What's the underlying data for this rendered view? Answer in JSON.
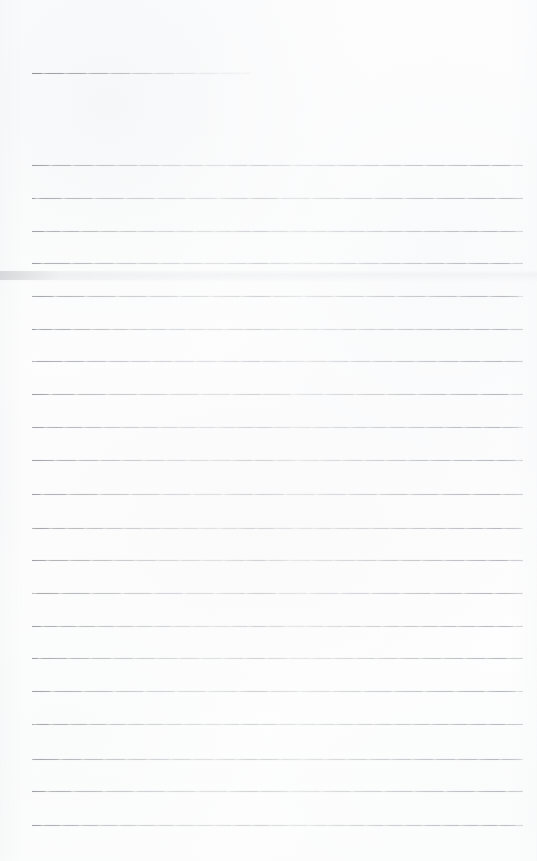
{
  "document": {
    "kind": "scanned-ruled-paper",
    "title": "",
    "visible_text": "",
    "page_width": 537,
    "page_height": 861,
    "background_color": "#fdfdfd",
    "rule_color": "#9a9da1",
    "rule_color_faded": "#c8cacd",
    "notes": "Blank scanned sheet of ruled writing paper. No printed words, numbers, headings or marks other than the horizontal ruling lines and scanner tone artifacts."
  },
  "ruling": {
    "margin_left": 32,
    "margin_right": 523,
    "line_spacing": 32.7,
    "first_line_y": 73,
    "last_line_y": 825,
    "line_count": 24,
    "lines": [
      {
        "y": 73,
        "x1": 32,
        "x2": 250,
        "variant": "short",
        "weight": 1
      },
      {
        "y": 165,
        "x1": 32,
        "x2": 523,
        "variant": "v1",
        "weight": 1
      },
      {
        "y": 198,
        "x1": 32,
        "x2": 523,
        "variant": "v2",
        "weight": 1
      },
      {
        "y": 231,
        "x1": 32,
        "x2": 523,
        "variant": "v3",
        "weight": 1
      },
      {
        "y": 263,
        "x1": 32,
        "x2": 523,
        "variant": "v1",
        "weight": 1
      },
      {
        "y": 296,
        "x1": 32,
        "x2": 523,
        "variant": "v2",
        "weight": 1
      },
      {
        "y": 329,
        "x1": 32,
        "x2": 523,
        "variant": "v3",
        "weight": 1
      },
      {
        "y": 361,
        "x1": 32,
        "x2": 523,
        "variant": "v1",
        "weight": 1
      },
      {
        "y": 394,
        "x1": 32,
        "x2": 523,
        "variant": "v2",
        "weight": 1
      },
      {
        "y": 427,
        "x1": 32,
        "x2": 523,
        "variant": "v3",
        "weight": 1
      },
      {
        "y": 460,
        "x1": 32,
        "x2": 523,
        "variant": "v1",
        "weight": 1
      },
      {
        "y": 494,
        "x1": 32,
        "x2": 523,
        "variant": "v2",
        "weight": 1
      },
      {
        "y": 528,
        "x1": 32,
        "x2": 523,
        "variant": "v3",
        "weight": 1
      },
      {
        "y": 560,
        "x1": 32,
        "x2": 523,
        "variant": "v1",
        "weight": 1
      },
      {
        "y": 593,
        "x1": 32,
        "x2": 523,
        "variant": "v2",
        "weight": 1
      },
      {
        "y": 626,
        "x1": 32,
        "x2": 523,
        "variant": "v3",
        "weight": 1
      },
      {
        "y": 658,
        "x1": 32,
        "x2": 523,
        "variant": "v1",
        "weight": 1
      },
      {
        "y": 691,
        "x1": 32,
        "x2": 523,
        "variant": "v2",
        "weight": 1
      },
      {
        "y": 724,
        "x1": 32,
        "x2": 523,
        "variant": "v3",
        "weight": 1
      },
      {
        "y": 759,
        "x1": 32,
        "x2": 523,
        "variant": "v1",
        "weight": 1
      },
      {
        "y": 791,
        "x1": 32,
        "x2": 523,
        "variant": "v2",
        "weight": 1
      },
      {
        "y": 825,
        "x1": 32,
        "x2": 523,
        "variant": "v3",
        "weight": 1
      }
    ]
  },
  "artifacts": {
    "scan_band": {
      "y": 270,
      "height": 12,
      "opacity": 0.55,
      "color": "#e2e4e6"
    },
    "left_edge_mark": {
      "y": 271,
      "height": 9,
      "color": "#cdd0d3"
    }
  }
}
